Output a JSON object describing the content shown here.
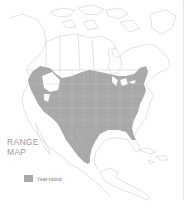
{
  "map": {
    "title_line1": "RANGE",
    "title_line2": "MAP",
    "title": "RANGE\nMAP",
    "region": "North America",
    "legend": [
      {
        "label": "Year-round",
        "color": "#a9a9a9"
      }
    ],
    "colors": {
      "range_fill": "#a9a9a9",
      "border_lines": "#c8c8c8",
      "background": "#ffffff",
      "title_text": "#9a9a9a"
    }
  }
}
